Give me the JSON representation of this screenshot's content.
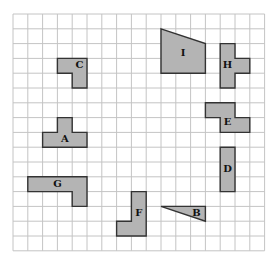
{
  "grid": {
    "origin_x": 13,
    "origin_y": 14,
    "cell": 14.8,
    "cols": 17,
    "rows": 16,
    "line_color": "#c4c4c4"
  },
  "shape_fill": "#b4b4b4",
  "shape_stroke": "#333333",
  "shapes": [
    {
      "id": "C",
      "label": "C",
      "points": [
        [
          3,
          3
        ],
        [
          5,
          3
        ],
        [
          5,
          5
        ],
        [
          4,
          5
        ],
        [
          4,
          4
        ],
        [
          3,
          4
        ]
      ],
      "label_pos": [
        4.5,
        3.5
      ]
    },
    {
      "id": "I",
      "label": "I",
      "points": [
        [
          10,
          1
        ],
        [
          13,
          2
        ],
        [
          13,
          4
        ],
        [
          10,
          4
        ]
      ],
      "label_pos": [
        11.5,
        2.7
      ]
    },
    {
      "id": "H",
      "label": "H",
      "points": [
        [
          14,
          2
        ],
        [
          15,
          2
        ],
        [
          15,
          3
        ],
        [
          16,
          3
        ],
        [
          16,
          4
        ],
        [
          15,
          4
        ],
        [
          15,
          5
        ],
        [
          14,
          5
        ]
      ],
      "label_pos": [
        14.5,
        3.5
      ]
    },
    {
      "id": "E",
      "label": "E",
      "points": [
        [
          13,
          6
        ],
        [
          15,
          6
        ],
        [
          15,
          7
        ],
        [
          16,
          7
        ],
        [
          16,
          8
        ],
        [
          15,
          8
        ],
        [
          14,
          8
        ],
        [
          14,
          7
        ],
        [
          13,
          7
        ]
      ],
      "label_pos": [
        14.5,
        7.3
      ]
    },
    {
      "id": "A",
      "label": "A",
      "points": [
        [
          3,
          7
        ],
        [
          4,
          7
        ],
        [
          4,
          8
        ],
        [
          5,
          8
        ],
        [
          5,
          9
        ],
        [
          2,
          9
        ],
        [
          2,
          8
        ],
        [
          3,
          8
        ]
      ],
      "label_pos": [
        3.5,
        8.5
      ]
    },
    {
      "id": "D",
      "label": "D",
      "points": [
        [
          14,
          9
        ],
        [
          15,
          9
        ],
        [
          15,
          12
        ],
        [
          14,
          12
        ]
      ],
      "label_pos": [
        14.5,
        10.5
      ]
    },
    {
      "id": "G",
      "label": "G",
      "points": [
        [
          1,
          11
        ],
        [
          5,
          11
        ],
        [
          5,
          13
        ],
        [
          4,
          13
        ],
        [
          4,
          12
        ],
        [
          1,
          12
        ]
      ],
      "label_pos": [
        3,
        11.5
      ]
    },
    {
      "id": "F",
      "label": "F",
      "points": [
        [
          8,
          12
        ],
        [
          9,
          12
        ],
        [
          9,
          15
        ],
        [
          7,
          15
        ],
        [
          7,
          14
        ],
        [
          8,
          14
        ]
      ],
      "label_pos": [
        8.5,
        13.5
      ]
    },
    {
      "id": "B",
      "label": "B",
      "points": [
        [
          10,
          13
        ],
        [
          13,
          13
        ],
        [
          13,
          14
        ]
      ],
      "label_pos": [
        12.4,
        13.45
      ]
    }
  ]
}
